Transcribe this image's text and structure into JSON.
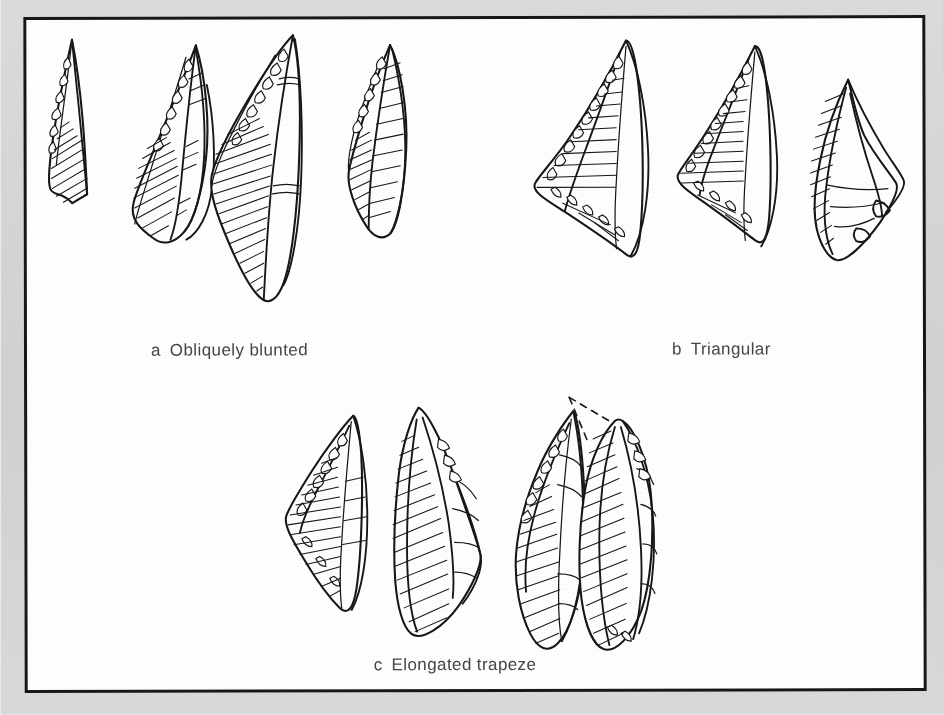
{
  "figure": {
    "kind": "archaeological-illustration",
    "background_color": "#d6d6d6",
    "plate_background_color": "#ffffff",
    "ink_color": "#15171a",
    "border_color": "#15171a"
  },
  "groups": [
    {
      "id": "a",
      "label": "a",
      "title": "Obliquely blunted",
      "caption": "a  Obliquely blunted",
      "artifact_count": 4,
      "artifacts": [
        {
          "name": "obliquely-blunted-point-1",
          "note": "narrow curved blade, steep retouch on left edge"
        },
        {
          "name": "obliquely-blunted-point-2",
          "note": "blade with scalloped retouch and dorsal ridge"
        },
        {
          "name": "obliquely-blunted-point-3",
          "note": "long blade, oblique truncation, dense hatching"
        },
        {
          "name": "obliquely-blunted-point-4",
          "note": "short broad blade, hatched ventral face"
        }
      ]
    },
    {
      "id": "b",
      "label": "b",
      "title": "Triangular",
      "caption": "b  Triangular",
      "artifact_count": 3,
      "artifacts": [
        {
          "name": "triangular-point-1",
          "note": "scalene triangle, retouched left and basal edges"
        },
        {
          "name": "triangular-point-2",
          "note": "scalene triangle with horizontal hatching"
        },
        {
          "name": "triangular-point-3",
          "note": "rhomboid/lozenge piece, hatched left facet"
        }
      ]
    },
    {
      "id": "c",
      "label": "c",
      "title": "Elongated trapeze",
      "caption": "c  Elongated trapeze",
      "artifact_count": 4,
      "artifacts": [
        {
          "name": "elongated-trapeze-1",
          "note": "trapeze with retouched left margin"
        },
        {
          "name": "elongated-trapeze-2",
          "note": "trapeze, long parallel hatching"
        },
        {
          "name": "elongated-trapeze-3",
          "note": "narrow elongated trapeze"
        },
        {
          "name": "elongated-trapeze-4",
          "note": "elongated trapeze with dashed reconstructed tip"
        }
      ]
    }
  ],
  "annotations": {
    "dashed_reconstruction": "dashed line indicating reconstructed missing tip on artifact c-4"
  }
}
